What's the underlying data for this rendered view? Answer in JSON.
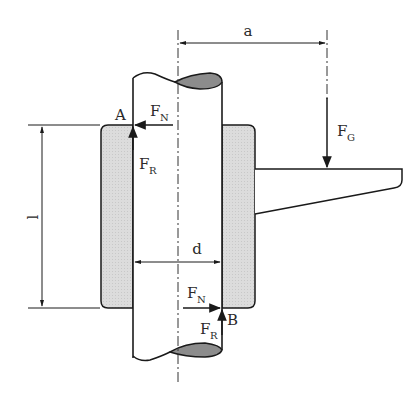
{
  "diagram": {
    "type": "mechanical free-body diagram",
    "colors": {
      "line": "#1a1a1a",
      "sleeve_fill": "#d9d9d9",
      "shaft_section_fill": "#8c8c8c",
      "background": "#ffffff"
    },
    "labels": {
      "point_a": "A",
      "point_b": "B",
      "force_normal_top": {
        "main": "F",
        "sub": "N"
      },
      "force_friction_top": {
        "main": "F",
        "sub": "R"
      },
      "force_normal_bottom": {
        "main": "F",
        "sub": "N"
      },
      "force_friction_bottom": {
        "main": "F",
        "sub": "R"
      },
      "force_weight": {
        "main": "F",
        "sub": "G"
      },
      "dim_a": "a",
      "dim_l": "l",
      "dim_d": "d"
    }
  }
}
